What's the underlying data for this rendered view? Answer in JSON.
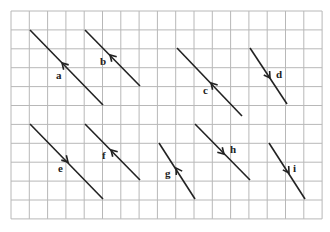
{
  "grid": {
    "x0": 11,
    "y0": 11,
    "cols": 17,
    "rows": 11,
    "dx": 18.3,
    "dy": 18.9,
    "color": "#b8b8b8"
  },
  "line_color": "#222222",
  "vectors": [
    {
      "label": "a",
      "x1": 30,
      "y1": 30,
      "x2": 103,
      "y2": 105,
      "arrow_at": [
        62,
        63
      ],
      "direction": "up-left",
      "lx": 56,
      "ly": 79
    },
    {
      "label": "b",
      "x1": 85,
      "y1": 30,
      "x2": 140,
      "y2": 86,
      "arrow_at": [
        110,
        55
      ],
      "direction": "up-left",
      "lx": 100,
      "ly": 65
    },
    {
      "label": "c",
      "x1": 177,
      "y1": 48,
      "x2": 242,
      "y2": 116,
      "arrow_at": [
        211,
        83
      ],
      "direction": "up-left",
      "lx": 203,
      "ly": 94
    },
    {
      "label": "d",
      "x1": 250,
      "y1": 48,
      "x2": 287,
      "y2": 104,
      "arrow_at": [
        270,
        78
      ],
      "direction": "down-right",
      "lx": 276,
      "ly": 78
    },
    {
      "label": "e",
      "x1": 30,
      "y1": 124,
      "x2": 103,
      "y2": 199,
      "arrow_at": [
        68,
        162
      ],
      "direction": "down-right",
      "lx": 58,
      "ly": 172
    },
    {
      "label": "f",
      "x1": 85,
      "y1": 124,
      "x2": 140,
      "y2": 180,
      "arrow_at": [
        111,
        150
      ],
      "direction": "up-left",
      "lx": 102,
      "ly": 159
    },
    {
      "label": "g",
      "x1": 159,
      "y1": 143,
      "x2": 195,
      "y2": 199,
      "arrow_at": [
        176,
        168
      ],
      "direction": "up-left",
      "lx": 165,
      "ly": 177
    },
    {
      "label": "h",
      "x1": 195,
      "y1": 124,
      "x2": 250,
      "y2": 180,
      "arrow_at": [
        224,
        154
      ],
      "direction": "down-right",
      "lx": 230,
      "ly": 153
    },
    {
      "label": "i",
      "x1": 269,
      "y1": 143,
      "x2": 305,
      "y2": 199,
      "arrow_at": [
        289,
        173
      ],
      "direction": "down-right",
      "lx": 293,
      "ly": 172
    }
  ]
}
